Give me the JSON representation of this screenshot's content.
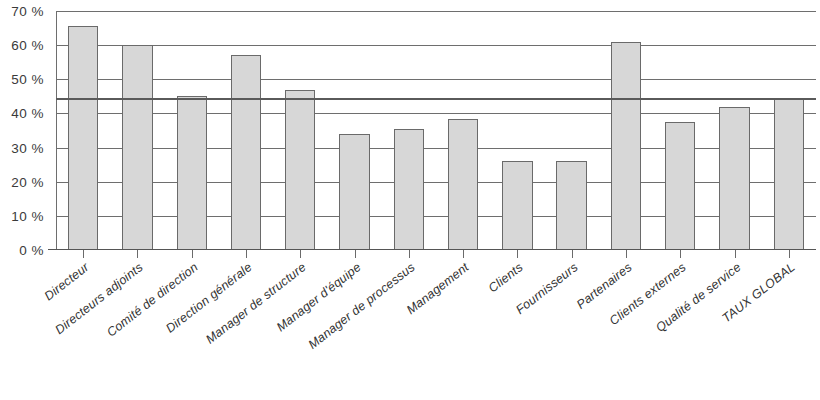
{
  "chart_data": {
    "type": "bar",
    "title": "",
    "xlabel": "",
    "ylabel": "",
    "ylim": [
      0,
      70
    ],
    "grid": true,
    "legend": "none",
    "ytick_labels": [
      "70 %",
      "60 %",
      "50 %",
      "40 %",
      "30 %",
      "20 %",
      "10 %",
      "0 %"
    ],
    "ytick_values": [
      70,
      60,
      50,
      40,
      30,
      20,
      10,
      0
    ],
    "categories": [
      "Directeur",
      "Directeurs adjoints",
      "Comité de direction",
      "Direction générale",
      "Manager de structure",
      "Manager d'équipe",
      "Manager de processus",
      "Management",
      "Clients",
      "Fournisseurs",
      "Partenaires",
      "Clients externes",
      "Qualité de service",
      "TAUX GLOBAL"
    ],
    "values": [
      65.5,
      60,
      45,
      57,
      47,
      34,
      35.5,
      38.5,
      26,
      26,
      61,
      37.5,
      42,
      44.5
    ],
    "reference_line": {
      "label": "taux global",
      "value": 44.5
    },
    "colors": {
      "bar_fill": "#d7d7d7",
      "bar_stroke": "#6a6a6a",
      "gridline": "#6e6e6e",
      "reference_line": "#5a5a5a",
      "text": "#333333"
    }
  }
}
